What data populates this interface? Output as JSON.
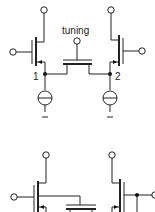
{
  "diagram": {
    "type": "circuit-schematic",
    "labels": {
      "tuning": "tuning",
      "node1": "1",
      "node2": "2",
      "minus_left": "–",
      "minus_right": "–"
    },
    "components": [
      {
        "id": "M1",
        "kind": "pmos-transistor",
        "position": "top-left"
      },
      {
        "id": "M2",
        "kind": "pmos-transistor",
        "position": "top-right"
      },
      {
        "id": "Mtune",
        "kind": "transistor",
        "label": "tuning",
        "position": "top-center"
      },
      {
        "id": "I1",
        "kind": "current-source",
        "node": "1"
      },
      {
        "id": "I2",
        "kind": "current-source",
        "node": "2"
      },
      {
        "id": "M3",
        "kind": "transistor",
        "position": "bottom-left"
      },
      {
        "id": "M4",
        "kind": "transistor",
        "position": "bottom-right"
      },
      {
        "id": "Mtune2",
        "kind": "transistor",
        "position": "bottom-center"
      }
    ],
    "colors": {
      "stroke": "#222222",
      "background": "#ffffff"
    }
  }
}
